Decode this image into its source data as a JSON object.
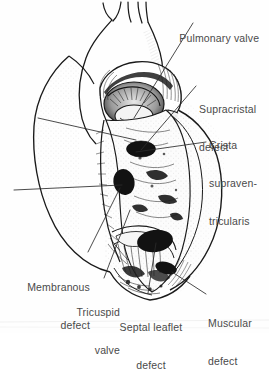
{
  "figure": {
    "kind": "anatomical-line-illustration",
    "style": "black and white pen-and-ink line drawing with stipple and hatch shading",
    "background_color": "#fefefe",
    "ink_color": "#1a1a1a",
    "label_color": "#4a4a4a"
  },
  "labels": {
    "pulmonary_valve": "Pulmonary valve",
    "supracristal_line1": "Supracristal",
    "supracristal_line2": "defect",
    "crista_line1": "Crista",
    "crista_line2": "supraven-",
    "crista_line3": "tricularis",
    "membranous_line1": "Membranous",
    "membranous_line2": "defect",
    "tricuspid_line1": "Tricuspid",
    "tricuspid_line2": "valve",
    "septal_leaflet_line1": "Septal leaflet",
    "septal_leaflet_line2": "defect",
    "muscular_line1": "Muscular",
    "muscular_line2": "defect"
  },
  "structures": [
    {
      "name": "great-vessel-branches",
      "description": "three small branching vessels at superior aspect"
    },
    {
      "name": "aortic-arch",
      "description": "large curved vessel trunk, left of midline"
    },
    {
      "name": "pulmonary-trunk",
      "description": "vessel rising from pulmonary valve, center"
    },
    {
      "name": "pulmonary-valve-cusps",
      "description": "dark shaded semilunar valve orifice"
    },
    {
      "name": "crista-supraventricularis",
      "description": "muscular ridge right of outflow tract"
    },
    {
      "name": "right-ventricle-free-wall",
      "description": "right lateral wall reflected open"
    },
    {
      "name": "left-ventricle-outline",
      "description": "left ventricular contour, left side"
    },
    {
      "name": "interventricular-septum",
      "description": "central septal surface with trabeculae"
    },
    {
      "name": "tricuspid-valve-leaflets",
      "description": "leaflets with chordae tendineae, lower center"
    },
    {
      "name": "papillary-muscles",
      "description": "trabecular muscle bundles, lower center"
    },
    {
      "name": "cardiac-apex",
      "description": "inferior point of heart"
    }
  ],
  "defects": [
    {
      "name": "supracristal-defect",
      "shape": "dark oval",
      "cx": 141,
      "cy": 149,
      "rx": 14,
      "ry": 8
    },
    {
      "name": "membranous-defect",
      "shape": "dark oval",
      "cx": 124,
      "cy": 182,
      "rx": 11,
      "ry": 13
    },
    {
      "name": "septal-leaflet-defect",
      "shape": "dark oval",
      "cx": 155,
      "cy": 241,
      "rx": 18,
      "ry": 11
    },
    {
      "name": "muscular-defect",
      "shape": "dark oval",
      "cx": 166,
      "cy": 268,
      "rx": 11,
      "ry": 6
    }
  ]
}
